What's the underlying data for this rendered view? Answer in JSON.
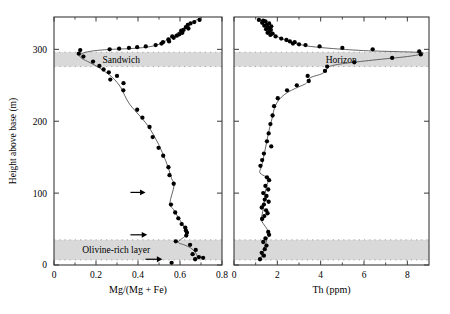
{
  "figure": {
    "background": "#ffffff",
    "band_color": "#d9d9d9",
    "axis_color": "#3a3a3a",
    "marker_color": "#000000",
    "curve_color": "#555555",
    "y_axis": {
      "label": "Height above base (m)",
      "ticks": [
        0,
        100,
        200,
        300
      ],
      "min": 0,
      "max": 345
    },
    "bands": [
      {
        "name": "sandwich",
        "label": "Sandwich",
        "y_top": 296,
        "y_bottom": 276,
        "label_x": 0.4,
        "panel": "left"
      },
      {
        "name": "olivine",
        "label": "Olivine-rich layer",
        "y_top": 35,
        "y_bottom": 7,
        "label_x": 0.37,
        "panel": "left"
      },
      {
        "name": "horizon",
        "label": "Horizon",
        "y_top": 296,
        "y_bottom": 276,
        "label_x": 0.55,
        "panel": "right"
      },
      {
        "name": "olivine-right",
        "label": "",
        "y_top": 35,
        "y_bottom": 7,
        "label_x": 0.5,
        "panel": "right"
      }
    ],
    "arrows": [
      {
        "name": "arrow-100m",
        "y": 101,
        "x_start": 0.455,
        "x_end": 0.545
      },
      {
        "name": "arrow-42m",
        "y": 42,
        "x_start": 0.455,
        "x_end": 0.555
      },
      {
        "name": "arrow-8m",
        "y": 8,
        "x_start": 0.545,
        "x_end": 0.645
      }
    ]
  },
  "chart_data": [
    {
      "type": "scatter",
      "name": "mg-number-profile",
      "title": "",
      "xlabel": "Mg/(Mg + Fe)",
      "ylabel": "Height above base (m)",
      "xlim": [
        0,
        0.8
      ],
      "ylim": [
        0,
        345
      ],
      "xticks": [
        0,
        0.2,
        0.4,
        0.6,
        0.8
      ],
      "xtick_labels": [
        "0",
        "0.2",
        "0.4",
        "0.6",
        "0.8"
      ],
      "yticks": [
        0,
        100,
        200,
        300
      ],
      "ytick_labels": [
        "0",
        "100",
        "200",
        "300"
      ],
      "grid": false,
      "legend": "none",
      "points": [
        [
          0.693,
          341
        ],
        [
          0.668,
          338
        ],
        [
          0.65,
          336
        ],
        [
          0.637,
          334
        ],
        [
          0.628,
          331
        ],
        [
          0.64,
          329
        ],
        [
          0.617,
          327
        ],
        [
          0.606,
          326
        ],
        [
          0.611,
          323
        ],
        [
          0.597,
          321
        ],
        [
          0.585,
          319
        ],
        [
          0.563,
          318
        ],
        [
          0.57,
          316
        ],
        [
          0.545,
          314
        ],
        [
          0.548,
          311
        ],
        [
          0.519,
          310
        ],
        [
          0.512,
          308
        ],
        [
          0.484,
          306
        ],
        [
          0.437,
          304
        ],
        [
          0.396,
          303
        ],
        [
          0.357,
          302
        ],
        [
          0.31,
          301
        ],
        [
          0.265,
          300
        ],
        [
          0.125,
          299
        ],
        [
          0.118,
          294
        ],
        [
          0.14,
          290
        ],
        [
          0.186,
          283
        ],
        [
          0.216,
          277
        ],
        [
          0.236,
          272
        ],
        [
          0.261,
          268
        ],
        [
          0.3,
          263
        ],
        [
          0.268,
          258
        ],
        [
          0.331,
          253
        ],
        [
          0.33,
          243
        ],
        [
          0.396,
          216
        ],
        [
          0.421,
          205
        ],
        [
          0.455,
          192
        ],
        [
          0.47,
          178
        ],
        [
          0.498,
          163
        ],
        [
          0.52,
          152
        ],
        [
          0.545,
          136
        ],
        [
          0.55,
          125
        ],
        [
          0.57,
          113
        ],
        [
          0.557,
          84
        ],
        [
          0.577,
          73
        ],
        [
          0.592,
          65
        ],
        [
          0.608,
          57
        ],
        [
          0.625,
          52
        ],
        [
          0.628,
          48
        ],
        [
          0.633,
          45
        ],
        [
          0.63,
          41
        ],
        [
          0.58,
          33
        ],
        [
          0.648,
          28
        ],
        [
          0.675,
          21
        ],
        [
          0.66,
          15
        ],
        [
          0.69,
          11
        ],
        [
          0.672,
          8
        ],
        [
          0.71,
          10
        ],
        [
          0.56,
          3
        ]
      ],
      "curve": [
        [
          0.7,
          344
        ],
        [
          0.66,
          338
        ],
        [
          0.62,
          330
        ],
        [
          0.585,
          322
        ],
        [
          0.545,
          314
        ],
        [
          0.5,
          307
        ],
        [
          0.44,
          303
        ],
        [
          0.36,
          301
        ],
        [
          0.27,
          300
        ],
        [
          0.19,
          298
        ],
        [
          0.14,
          295
        ],
        [
          0.122,
          291
        ],
        [
          0.135,
          287
        ],
        [
          0.168,
          282
        ],
        [
          0.2,
          277
        ],
        [
          0.228,
          272
        ],
        [
          0.252,
          267
        ],
        [
          0.278,
          261
        ],
        [
          0.3,
          254
        ],
        [
          0.318,
          247
        ],
        [
          0.33,
          240
        ],
        [
          0.345,
          231
        ],
        [
          0.362,
          223
        ],
        [
          0.385,
          215
        ],
        [
          0.41,
          207
        ],
        [
          0.436,
          198
        ],
        [
          0.458,
          189
        ],
        [
          0.478,
          179
        ],
        [
          0.498,
          168
        ],
        [
          0.515,
          157
        ],
        [
          0.532,
          145
        ],
        [
          0.548,
          132
        ],
        [
          0.56,
          120
        ],
        [
          0.572,
          111
        ],
        [
          0.552,
          86
        ],
        [
          0.57,
          77
        ],
        [
          0.588,
          68
        ],
        [
          0.605,
          60
        ],
        [
          0.62,
          53
        ],
        [
          0.63,
          47
        ],
        [
          0.632,
          42
        ],
        [
          0.592,
          32
        ],
        [
          0.62,
          28
        ],
        [
          0.65,
          24
        ],
        [
          0.672,
          18
        ],
        [
          0.682,
          12
        ],
        [
          0.678,
          7
        ]
      ]
    },
    {
      "type": "scatter",
      "name": "thorium-profile",
      "title": "",
      "xlabel": "Th (ppm)",
      "ylabel": "Height above base (m)",
      "xlim": [
        0,
        9
      ],
      "ylim": [
        0,
        345
      ],
      "xticks": [
        0,
        2,
        4,
        6,
        8
      ],
      "xtick_labels": [
        "0",
        "2",
        "4",
        "6",
        "8"
      ],
      "yticks": [
        0,
        100,
        200,
        300
      ],
      "ytick_labels": [
        "0",
        "100",
        "200",
        "300"
      ],
      "grid": false,
      "legend": "none",
      "points": [
        [
          1.15,
          341
        ],
        [
          1.35,
          340
        ],
        [
          1.45,
          339
        ],
        [
          1.3,
          337
        ],
        [
          1.62,
          336
        ],
        [
          1.52,
          334
        ],
        [
          1.4,
          333
        ],
        [
          1.72,
          332
        ],
        [
          1.58,
          330
        ],
        [
          1.48,
          328
        ],
        [
          1.7,
          327
        ],
        [
          1.62,
          325
        ],
        [
          1.55,
          323
        ],
        [
          1.78,
          322
        ],
        [
          1.68,
          320
        ],
        [
          1.92,
          318
        ],
        [
          2.18,
          315
        ],
        [
          2.42,
          313
        ],
        [
          2.58,
          311
        ],
        [
          2.8,
          310
        ],
        [
          2.72,
          308
        ],
        [
          3.0,
          307
        ],
        [
          3.3,
          306
        ],
        [
          3.95,
          304
        ],
        [
          5.0,
          302
        ],
        [
          6.4,
          300
        ],
        [
          8.55,
          297
        ],
        [
          8.62,
          293
        ],
        [
          7.3,
          288
        ],
        [
          5.55,
          282
        ],
        [
          4.3,
          276
        ],
        [
          4.2,
          270
        ],
        [
          3.4,
          263
        ],
        [
          3.45,
          256
        ],
        [
          2.9,
          250
        ],
        [
          2.45,
          243
        ],
        [
          2.02,
          232
        ],
        [
          1.85,
          221
        ],
        [
          1.78,
          208
        ],
        [
          1.68,
          196
        ],
        [
          1.6,
          183
        ],
        [
          1.52,
          172
        ],
        [
          1.72,
          165
        ],
        [
          1.38,
          155
        ],
        [
          1.3,
          146
        ],
        [
          1.22,
          138
        ],
        [
          1.52,
          122
        ],
        [
          1.62,
          118
        ],
        [
          1.45,
          110
        ],
        [
          1.58,
          105
        ],
        [
          1.35,
          100
        ],
        [
          1.5,
          96
        ],
        [
          1.42,
          91
        ],
        [
          1.6,
          88
        ],
        [
          1.38,
          84
        ],
        [
          1.28,
          80
        ],
        [
          1.48,
          76
        ],
        [
          1.55,
          72
        ],
        [
          1.4,
          68
        ],
        [
          1.3,
          64
        ],
        [
          1.58,
          46
        ],
        [
          1.62,
          42
        ],
        [
          1.45,
          37
        ],
        [
          1.35,
          32
        ],
        [
          1.5,
          27
        ],
        [
          1.42,
          22
        ],
        [
          1.28,
          17
        ],
        [
          1.38,
          13
        ],
        [
          1.2,
          8
        ]
      ],
      "curve": [
        [
          1.3,
          341
        ],
        [
          1.45,
          336
        ],
        [
          1.55,
          331
        ],
        [
          1.68,
          326
        ],
        [
          1.82,
          321
        ],
        [
          2.05,
          317
        ],
        [
          2.35,
          313
        ],
        [
          2.65,
          310
        ],
        [
          3.0,
          307
        ],
        [
          3.55,
          304
        ],
        [
          4.6,
          301
        ],
        [
          6.2,
          298
        ],
        [
          8.4,
          296
        ],
        [
          8.7,
          294
        ],
        [
          8.0,
          290
        ],
        [
          6.4,
          285
        ],
        [
          5.0,
          280
        ],
        [
          4.4,
          276
        ],
        [
          4.25,
          271
        ],
        [
          4.05,
          266
        ],
        [
          3.55,
          261
        ],
        [
          3.42,
          256
        ],
        [
          3.3,
          252
        ],
        [
          3.0,
          248
        ],
        [
          2.65,
          243
        ],
        [
          2.32,
          237
        ],
        [
          2.08,
          230
        ],
        [
          1.92,
          222
        ],
        [
          1.82,
          213
        ],
        [
          1.75,
          203
        ],
        [
          1.66,
          193
        ],
        [
          1.58,
          182
        ],
        [
          1.5,
          170
        ],
        [
          1.42,
          158
        ],
        [
          1.34,
          146
        ],
        [
          1.26,
          136
        ],
        [
          1.2,
          128
        ],
        [
          1.58,
          120
        ],
        [
          1.5,
          110
        ],
        [
          1.44,
          100
        ],
        [
          1.4,
          90
        ],
        [
          1.36,
          80
        ],
        [
          1.3,
          70
        ],
        [
          1.26,
          62
        ],
        [
          1.62,
          45
        ],
        [
          1.52,
          36
        ],
        [
          1.44,
          27
        ],
        [
          1.34,
          18
        ],
        [
          1.22,
          9
        ]
      ]
    }
  ]
}
